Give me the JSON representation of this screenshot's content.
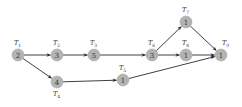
{
  "diagram": {
    "type": "task-graph",
    "node_color": "#b3b3b3",
    "edge_color": "#2a2a2a",
    "nodes": [
      {
        "id": "T1",
        "label": "T",
        "sub": "1",
        "weight": "2",
        "x": 18,
        "y": 55,
        "lx": 14,
        "ly": 45
      },
      {
        "id": "T2",
        "label": "T",
        "sub": "2",
        "weight": "3",
        "x": 57,
        "y": 55,
        "lx": 53,
        "ly": 45
      },
      {
        "id": "T3",
        "label": "T",
        "sub": "3",
        "weight": "5",
        "x": 94,
        "y": 55,
        "lx": 90,
        "ly": 45
      },
      {
        "id": "T4",
        "label": "T",
        "sub": "4",
        "weight": "4",
        "x": 57,
        "y": 82,
        "lx": 53,
        "ly": 96
      },
      {
        "id": "T5",
        "label": "T",
        "sub": "5",
        "weight": "1",
        "x": 123,
        "y": 80,
        "lx": 119,
        "ly": 70
      },
      {
        "id": "T6",
        "label": "T",
        "sub": "6",
        "weight": "3",
        "x": 152,
        "y": 55,
        "lx": 148,
        "ly": 45
      },
      {
        "id": "T7",
        "label": "T",
        "sub": "7",
        "weight": "1",
        "x": 186,
        "y": 22,
        "lx": 182,
        "ly": 12
      },
      {
        "id": "T8",
        "label": "T",
        "sub": "8",
        "weight": "1",
        "x": 186,
        "y": 55,
        "lx": 182,
        "ly": 45
      },
      {
        "id": "T9",
        "label": "T",
        "sub": "9",
        "weight": "1",
        "x": 221,
        "y": 55,
        "lx": 222,
        "ly": 45
      }
    ],
    "edges": [
      {
        "from": "T1",
        "to": "T2"
      },
      {
        "from": "T1",
        "to": "T4"
      },
      {
        "from": "T2",
        "to": "T3"
      },
      {
        "from": "T3",
        "to": "T6"
      },
      {
        "from": "T4",
        "to": "T5"
      },
      {
        "from": "T6",
        "to": "T7"
      },
      {
        "from": "T6",
        "to": "T8"
      },
      {
        "from": "T7",
        "to": "T9"
      },
      {
        "from": "T8",
        "to": "T9"
      },
      {
        "from": "T5",
        "to": "T9"
      }
    ]
  }
}
